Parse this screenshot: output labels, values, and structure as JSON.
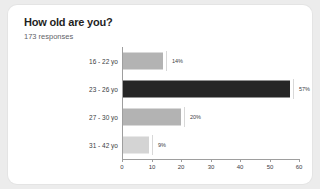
{
  "card": {
    "title": "How old are you?",
    "response_count": "173 responses",
    "background": "#ffffff",
    "page_background": "#ececec"
  },
  "chart_data": {
    "type": "bar",
    "orientation": "horizontal",
    "title": "How old are you?",
    "subtitle": "173 responses",
    "xlabel": "",
    "ylabel": "",
    "categories": [
      "16 - 22 yo",
      "23 - 26 yo",
      "27 - 30 yo",
      "31 - 42 yo"
    ],
    "values": [
      14,
      57,
      20,
      9
    ],
    "value_labels": [
      "14%",
      "57%",
      "20%",
      "9%"
    ],
    "colors": [
      "#b3b3b3",
      "#262626",
      "#b3b3b3",
      "#d4d4d4"
    ],
    "xlim": [
      0,
      60
    ],
    "xticks": [
      0,
      10,
      20,
      30,
      40,
      50,
      60
    ],
    "xtick_labels": [
      "0",
      "10",
      "20",
      "30",
      "40",
      "50",
      "60"
    ],
    "grid": false,
    "legend": false,
    "axis_color": "#9e9e9e",
    "label_color": "#3c4043"
  }
}
